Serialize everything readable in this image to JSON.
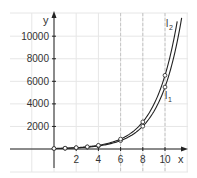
{
  "chart_data": {
    "type": "line",
    "title": "",
    "xlabel": "x",
    "ylabel": "y",
    "xlim": [
      -4,
      11.5
    ],
    "ylim": [
      -1000,
      11500
    ],
    "x_ticks": [
      2,
      4,
      6,
      8,
      10
    ],
    "x_tick_labels": [
      "2",
      "4",
      "6",
      "8",
      "10"
    ],
    "y_ticks": [
      2000,
      4000,
      6000,
      8000,
      10000
    ],
    "y_tick_labels": [
      "2000",
      "4000",
      "6000",
      "8000",
      "10000"
    ],
    "grid": true,
    "dashed_reference_x": [
      6,
      8,
      10
    ],
    "series": [
      {
        "name": "l1",
        "label_main": "l",
        "label_sub": "1",
        "x": [
          0,
          1,
          2,
          3,
          4,
          6,
          8,
          10
        ],
        "values": [
          37,
          61,
          101,
          166,
          274,
          743,
          2020,
          5490
        ]
      },
      {
        "name": "l2",
        "label_main": "l",
        "label_sub": "2",
        "x": [
          0,
          1,
          2,
          3,
          4,
          6,
          8,
          10
        ],
        "values": [
          44,
          73,
          120,
          197,
          325,
          884,
          2402,
          6530
        ]
      }
    ],
    "colors": {
      "axis": "#222222",
      "grid": "#e6e6e6",
      "dashed": "#bbbbbb",
      "line": "#222222",
      "marker_fill": "#ffffff"
    }
  }
}
